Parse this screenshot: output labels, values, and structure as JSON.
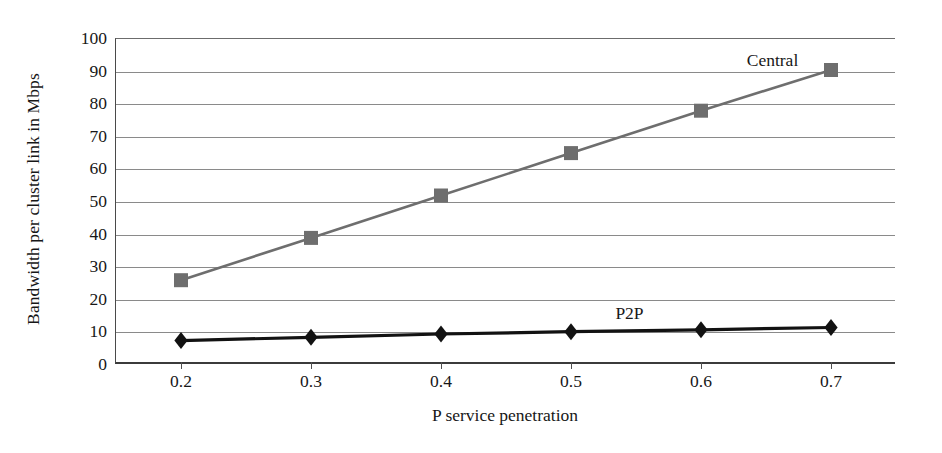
{
  "chart_data": {
    "type": "line",
    "title": "",
    "xlabel": "P service penetration",
    "ylabel": "Bandwidth per cluster link in Mbps",
    "x": [
      0.2,
      0.3,
      0.4,
      0.5,
      0.6,
      0.7
    ],
    "xtick_labels": [
      "0.2",
      "0.3",
      "0.4",
      "0.5",
      "0.6",
      "0.7"
    ],
    "ytick_labels": [
      "0",
      "10",
      "20",
      "30",
      "40",
      "50",
      "60",
      "70",
      "80",
      "90",
      "100"
    ],
    "yticks": [
      0,
      10,
      20,
      30,
      40,
      50,
      60,
      70,
      80,
      90,
      100
    ],
    "ylim": [
      0,
      100
    ],
    "xlim": [
      0.15,
      0.75
    ],
    "grid": "horizontal",
    "legend_position": "inline-annotations",
    "series": [
      {
        "name": "Central",
        "values": [
          26,
          39,
          52,
          65,
          78,
          90.5
        ],
        "color": "#6e6e6e",
        "marker": "square",
        "label_x": 0.655,
        "label_y": 96
      },
      {
        "name": "P2P",
        "values": [
          7.5,
          8.5,
          9.5,
          10.2,
          10.8,
          11.5
        ],
        "color": "#121212",
        "marker": "diamond",
        "label_x": 0.545,
        "label_y": 18.5
      }
    ],
    "annotations": [
      {
        "text": "Central",
        "near": "top-right of Central series"
      },
      {
        "text": "P2P",
        "near": "above P2P series"
      }
    ]
  }
}
